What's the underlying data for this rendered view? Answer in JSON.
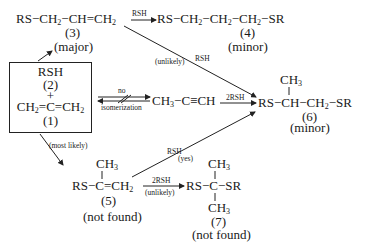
{
  "compounds": {
    "c3": {
      "formula": "RS−CH₂−CH=CH₂",
      "number": "(3)",
      "note": "(major)"
    },
    "c4": {
      "formula": "RS−CH₂−CH₂−CH₂−SR",
      "number": "(4)",
      "note": "(minor)"
    },
    "c2": {
      "formula": "RSH",
      "number": "(2)",
      "plus": "+"
    },
    "c1": {
      "formula": "CH₂=C=CH₂",
      "number": "(1)"
    },
    "propyne": {
      "formula": "CH₃−C≡CH"
    },
    "c6": {
      "formula": "RS−CH−CH₂−SR",
      "branch": "CH₃",
      "number": "(6)",
      "note": "(minor)"
    },
    "c5": {
      "formula": "RS−C=CH₂",
      "branch": "CH₃",
      "number": "(5)",
      "note": "(not found)"
    },
    "c7": {
      "formula": "RS−C−SR",
      "branch_top": "CH₃",
      "branch_bottom": "CH₃",
      "number": "(7)",
      "note": "(not found)"
    }
  },
  "arrows": {
    "c3_to_c4": {
      "above": "RSH"
    },
    "c3_to_c6": {
      "above": "RSH",
      "below": "(unlikely)"
    },
    "c1_isomerization": {
      "above": "no",
      "below": "isomerization"
    },
    "propyne_to_c6": {
      "above": "2RSH"
    },
    "c1_to_c5": {
      "label": "(most likely)"
    },
    "c5_to_c6": {
      "above": "RSH",
      "below": "(yes)"
    },
    "c5_to_c7": {
      "above": "2RSH",
      "below": "(unlikely)"
    }
  }
}
